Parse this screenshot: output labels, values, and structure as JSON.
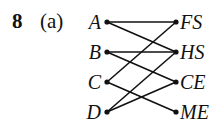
{
  "question": {
    "number": "8",
    "part": "(a)"
  },
  "graph": {
    "left_nodes": [
      {
        "id": "A",
        "label": "A",
        "y": 22
      },
      {
        "id": "B",
        "label": "B",
        "y": 52
      },
      {
        "id": "C",
        "label": "C",
        "y": 82
      },
      {
        "id": "D",
        "label": "D",
        "y": 112
      }
    ],
    "right_nodes": [
      {
        "id": "FS",
        "label": "FS",
        "y": 22
      },
      {
        "id": "HS",
        "label": "HS",
        "y": 52
      },
      {
        "id": "CE",
        "label": "CE",
        "y": 82
      },
      {
        "id": "ME",
        "label": "ME",
        "y": 112
      }
    ],
    "edges": [
      [
        "A",
        "FS"
      ],
      [
        "A",
        "HS"
      ],
      [
        "B",
        "HS"
      ],
      [
        "B",
        "CE"
      ],
      [
        "C",
        "FS"
      ],
      [
        "C",
        "ME"
      ],
      [
        "D",
        "HS"
      ],
      [
        "D",
        "CE"
      ]
    ],
    "left_x": 107,
    "right_x": 176,
    "line_color": "#111111"
  }
}
